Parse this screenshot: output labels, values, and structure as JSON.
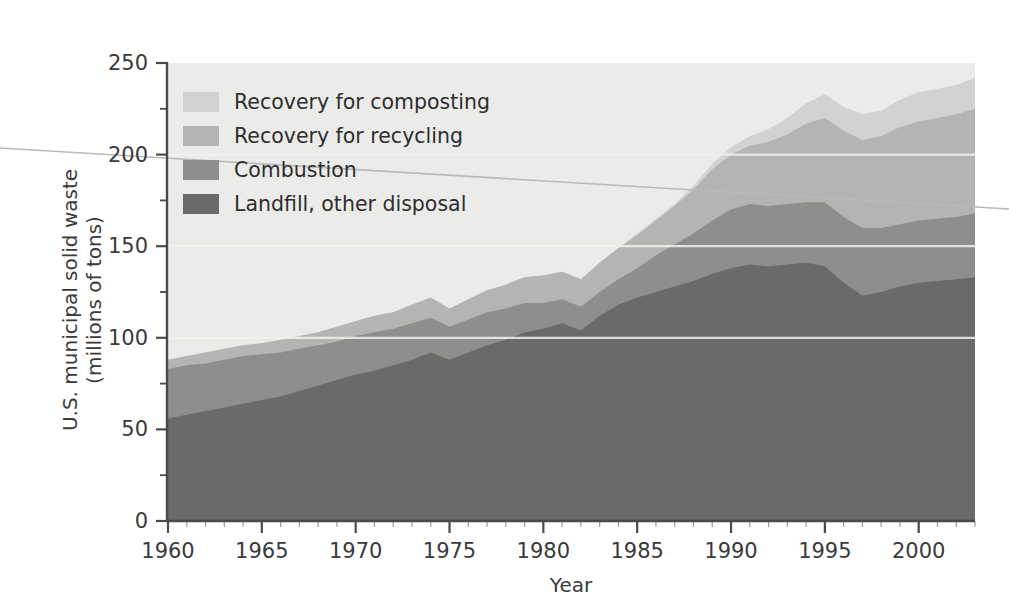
{
  "figure": {
    "background_color": "#ffffff",
    "plot_background_color": "#ebebe9"
  },
  "axes": {
    "y": {
      "title_line1": "U.S. municipal solid waste",
      "title_line2": "(millions of tons)",
      "ticks": [
        "0",
        "50",
        "100",
        "150",
        "200",
        "250"
      ],
      "min": 0,
      "max": 250,
      "minor_tick_step": 25
    },
    "x": {
      "title": "Year",
      "ticks": [
        "1960",
        "1965",
        "1970",
        "1975",
        "1980",
        "1985",
        "1990",
        "1995",
        "2000"
      ],
      "min": 1960,
      "max": 2003,
      "minor_tick_step": 1
    }
  },
  "legend": {
    "items": [
      {
        "label": "Recovery for composting",
        "color": "#d2d2d0",
        "swatch": "legend-swatch-composting"
      },
      {
        "label": "Recovery for recycling",
        "color": "#b4b4b2",
        "swatch": "legend-swatch-recycling"
      },
      {
        "label": "Combustion",
        "color": "#8e8e8c",
        "swatch": "legend-swatch-combustion"
      },
      {
        "label": "Landfill, other disposal",
        "color": "#6a6a68",
        "swatch": "legend-swatch-landfill"
      }
    ]
  },
  "chart_data": {
    "type": "area",
    "title": "",
    "subtitle": "",
    "xlabel": "Year",
    "ylabel": "U.S. municipal solid waste (millions of tons)",
    "xlim": [
      1960,
      2003
    ],
    "ylim": [
      0,
      250
    ],
    "grid": false,
    "stacked": true,
    "stack_order_bottom_to_top": [
      "Landfill, other disposal",
      "Combustion",
      "Recovery for recycling",
      "Recovery for composting"
    ],
    "legend_position": "upper-left-inside",
    "x": [
      1960,
      1961,
      1962,
      1963,
      1964,
      1965,
      1966,
      1967,
      1968,
      1969,
      1970,
      1971,
      1972,
      1973,
      1974,
      1975,
      1976,
      1977,
      1978,
      1979,
      1980,
      1981,
      1982,
      1983,
      1984,
      1985,
      1986,
      1987,
      1988,
      1989,
      1990,
      1991,
      1992,
      1993,
      1994,
      1995,
      1996,
      1997,
      1998,
      1999,
      2000,
      2001,
      2002,
      2003
    ],
    "series": [
      {
        "name": "Landfill, other disposal",
        "color": "#6a6a68",
        "values": [
          56,
          58,
          60,
          62,
          64,
          66,
          68,
          71,
          74,
          77,
          80,
          82,
          85,
          88,
          92,
          88,
          92,
          96,
          99,
          103,
          105,
          108,
          104,
          112,
          118,
          122,
          125,
          128,
          131,
          135,
          138,
          140,
          139,
          140,
          141,
          139,
          130,
          123,
          125,
          128,
          130,
          131,
          132,
          133
        ]
      },
      {
        "name": "Combustion",
        "color": "#8e8e8c",
        "values": [
          27,
          27,
          26,
          26,
          26,
          25,
          24,
          23,
          22,
          21,
          21,
          21,
          20,
          20,
          19,
          18,
          18,
          18,
          17,
          16,
          14,
          13,
          13,
          13,
          14,
          16,
          20,
          23,
          26,
          29,
          32,
          33,
          33,
          33,
          33,
          35,
          36,
          37,
          35,
          34,
          34,
          34,
          34,
          35
        ]
      },
      {
        "name": "Recovery for recycling",
        "color": "#b4b4b2",
        "values": [
          5,
          5,
          6,
          6,
          6,
          6,
          7,
          7,
          7,
          8,
          8,
          9,
          9,
          10,
          11,
          10,
          11,
          12,
          13,
          14,
          15,
          15,
          15,
          16,
          17,
          18,
          19,
          21,
          24,
          28,
          30,
          32,
          35,
          38,
          43,
          46,
          47,
          48,
          50,
          53,
          54,
          55,
          56,
          57
        ]
      },
      {
        "name": "Recovery for composting",
        "color": "#d2d2d0",
        "values": [
          0,
          0,
          0,
          0,
          0,
          0,
          0,
          0,
          0,
          0,
          0,
          0,
          0,
          0,
          0,
          0,
          0,
          0,
          0,
          0,
          0,
          0,
          0,
          0,
          0,
          1,
          1,
          1,
          2,
          3,
          4,
          5,
          7,
          9,
          11,
          13,
          13,
          14,
          14,
          15,
          16,
          16,
          16,
          17
        ]
      }
    ],
    "totals": [
      88,
      90,
      92,
      94,
      96,
      97,
      99,
      101,
      103,
      106,
      109,
      112,
      114,
      118,
      122,
      116,
      121,
      126,
      129,
      133,
      134,
      136,
      132,
      141,
      149,
      157,
      165,
      173,
      183,
      195,
      204,
      210,
      214,
      220,
      228,
      233,
      226,
      222,
      224,
      230,
      234,
      236,
      238,
      242
    ]
  }
}
